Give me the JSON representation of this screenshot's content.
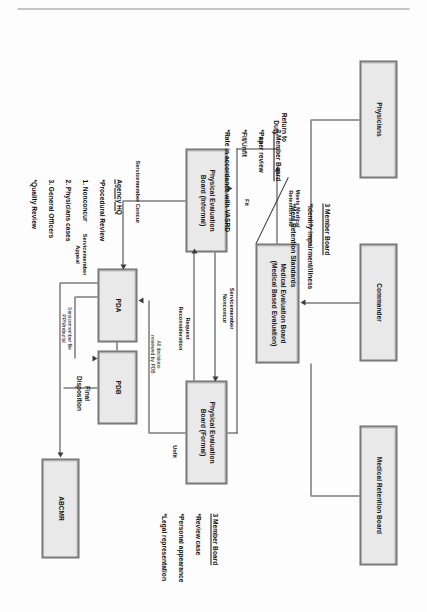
{
  "diagram": {
    "orientation": "landscape content rotated 90 degrees in portrait frame",
    "nodes": [
      {
        "id": "physicians",
        "label": "Physicians"
      },
      {
        "id": "commander",
        "label": "Commander"
      },
      {
        "id": "medical_retention_board",
        "label": "Medical Retention Board"
      },
      {
        "id": "meb",
        "label": "Medical Evaluation Board\n(Medical Based Evaluation)"
      },
      {
        "id": "peb_informal",
        "label": "Physical Evaluation\nBoard (Informal)"
      },
      {
        "id": "peb_formal",
        "label": "Physical Evaluation\nBoard (Formal)"
      },
      {
        "id": "pda",
        "label": "PDA"
      },
      {
        "id": "pdb",
        "label": "PDB"
      },
      {
        "id": "abcmr",
        "label": "ABCMR"
      }
    ],
    "edge_labels": [
      {
        "id": "meets_retention",
        "label": "Meets Medical\nRetention Std"
      },
      {
        "id": "return_to_duty",
        "label": "Return to\nDuty"
      },
      {
        "id": "fit_upper",
        "label": "Fit"
      },
      {
        "id": "fit_lower",
        "label": "Fit"
      },
      {
        "id": "unfit",
        "label": "Unfit"
      },
      {
        "id": "sm_nonconcur",
        "label": "Servicemember\nNonconcur"
      },
      {
        "id": "request_recon",
        "label": "Request\nReconsideration"
      },
      {
        "id": "sm_concur",
        "label": "Servicemember Concur"
      },
      {
        "id": "all_decisions",
        "label": "All decisions\nreviewed by PDB"
      },
      {
        "id": "sm_file",
        "label": "Servicemember file\nPPN/rebuttal"
      },
      {
        "id": "final_disp",
        "label": "Final\nDisposition"
      },
      {
        "id": "sm_appeal",
        "label": "Servicemember\nAppeal"
      }
    ],
    "annotations": [
      {
        "id": "meb_note",
        "heading": "3 Member Board",
        "lines": [
          "*Identify impairment/illness",
          "*Meet Retention Standards"
        ]
      },
      {
        "id": "peb_informal_note",
        "heading": "3 Member Board",
        "lines": [
          "*Paper review",
          "*Fit/Unfit",
          "*Rate in accordance with VASRD"
        ]
      },
      {
        "id": "peb_formal_note",
        "heading": "3 Member Board",
        "lines": [
          "*Review case",
          "*Personal appearance",
          "*Legal representation"
        ]
      },
      {
        "id": "agency_hq_note",
        "heading": "Agency HQ",
        "lines": [
          "*Procedural Review",
          "1. Nonconcur",
          "2. Physicians cases",
          "3. General Officers",
          "*Quality Review"
        ]
      }
    ],
    "colors": {
      "box_fill": "#e9e9e9",
      "box_border": "#7a7a7a",
      "line": "#3d3d3d",
      "text": "#111111",
      "background": "#fdfdfd"
    }
  }
}
